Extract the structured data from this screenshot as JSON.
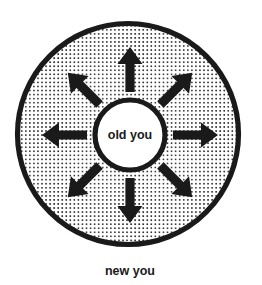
{
  "diagram": {
    "type": "concentric-circles-radiating-arrows",
    "title_inner": "old you",
    "title_outer": "new you",
    "colors": {
      "background": "#ffffff",
      "stroke": "#1a1a1a",
      "dot_fill": "#1a1a1a",
      "inner_fill": "#ffffff",
      "text": "#1a1a1a"
    },
    "outer_circle": {
      "name": "outer-circle",
      "center_x": 128,
      "center_y": 134,
      "radius": 113,
      "stroke_width": 5,
      "fill_pattern": "dot-halftone",
      "dot_spacing": 4.05,
      "dot_radius": 0.85
    },
    "inner_circle": {
      "name": "inner-circle",
      "center_x": 130,
      "center_y": 135,
      "radius": 35,
      "stroke_width": 5,
      "fill": "solid-white",
      "label": "old you"
    },
    "arrows": {
      "count": 8,
      "inner_offset": 43,
      "outer_offset": 88,
      "shaft_half_width": 4.5,
      "head_half_width": 12.5,
      "head_length": 17,
      "directions": [
        {
          "name": "arrow-north",
          "angle_deg": -90,
          "label": "up"
        },
        {
          "name": "arrow-northeast",
          "angle_deg": -45,
          "label": "up-right"
        },
        {
          "name": "arrow-east",
          "angle_deg": 0,
          "label": "right"
        },
        {
          "name": "arrow-southeast",
          "angle_deg": 45,
          "label": "down-right"
        },
        {
          "name": "arrow-south",
          "angle_deg": 90,
          "label": "down"
        },
        {
          "name": "arrow-southwest",
          "angle_deg": 135,
          "label": "down-left"
        },
        {
          "name": "arrow-west",
          "angle_deg": 180,
          "label": "left"
        },
        {
          "name": "arrow-northwest",
          "angle_deg": 225,
          "label": "up-left"
        }
      ]
    },
    "caption": {
      "name": "caption-new-you",
      "text": "new you",
      "x": 130,
      "y": 271
    }
  }
}
